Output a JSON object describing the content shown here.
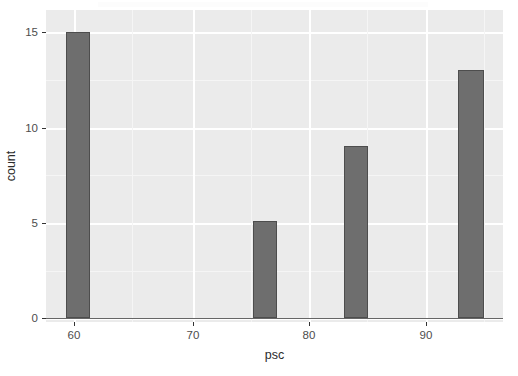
{
  "chart_data": {
    "type": "bar",
    "title": "",
    "subtitle": "",
    "xlabel": "psc",
    "ylabel": "count",
    "xlim": [
      57.8,
      97.3
    ],
    "ylim": [
      0,
      15.6
    ],
    "grid": true,
    "legend": false,
    "legend_position": "none",
    "bar_width_data_units": 2.07,
    "x_ticks": [
      60,
      70,
      80,
      90
    ],
    "x_tick_labels": [
      "60",
      "70",
      "80",
      "90"
    ],
    "y_ticks": [
      0,
      5,
      10,
      15
    ],
    "y_tick_labels": [
      "0",
      "5",
      "10",
      "15"
    ],
    "x": [
      60.73,
      75.42,
      83.92,
      93.28
    ],
    "values": [
      15,
      5,
      9,
      13
    ],
    "categories": [
      "60.73",
      "75.42",
      "83.92",
      "93.28"
    ],
    "series": [
      {
        "name": "count",
        "values": [
          15,
          5,
          9,
          13
        ]
      }
    ],
    "bars": [
      {
        "x_center": 60.73,
        "count": 15,
        "left_px": 66,
        "width_px": 24,
        "top_px": 32
      },
      {
        "x_center": 75.42,
        "count": 5,
        "left_px": 253,
        "width_px": 24,
        "top_px": 221
      },
      {
        "x_center": 83.92,
        "count": 9,
        "left_px": 344,
        "width_px": 24,
        "top_px": 146
      },
      {
        "x_center": 93.28,
        "count": 13,
        "left_px": 458,
        "width_px": 26,
        "top_px": 70
      }
    ]
  },
  "axes": {
    "x": {
      "title": "psc",
      "ticks": [
        {
          "label": "60",
          "px": 74
        },
        {
          "label": "70",
          "px": 193
        },
        {
          "label": "80",
          "px": 309
        },
        {
          "label": "90",
          "px": 426
        }
      ]
    },
    "y": {
      "title": "count",
      "ticks": [
        {
          "label": "0",
          "px": 318
        },
        {
          "label": "5",
          "px": 223
        },
        {
          "label": "10",
          "px": 128
        },
        {
          "label": "15",
          "px": 32
        }
      ]
    }
  },
  "theme": {
    "panel_background": "#ebebeb",
    "plot_background": "#ffffff",
    "major_grid_color": "#ffffff",
    "minor_grid_color": "#f5f5f5",
    "bar_fill": "#6e6e6e",
    "bar_outline": "#4d4d4d",
    "axis_text_color": "#4d4d4d",
    "axis_title_color": "#2b2b2b",
    "axis_line_color": "#666666"
  }
}
